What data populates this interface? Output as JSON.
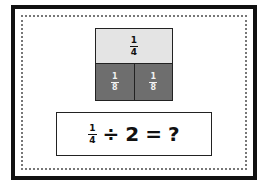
{
  "card": {
    "bar_model": {
      "top": {
        "numerator": "1",
        "denominator": "4"
      },
      "bottom": [
        {
          "numerator": "1",
          "denominator": "8"
        },
        {
          "numerator": "1",
          "denominator": "8"
        }
      ]
    },
    "equation": {
      "fraction": {
        "numerator": "1",
        "denominator": "4"
      },
      "operator": "÷",
      "divisor": "2",
      "equals": "=",
      "result": "?"
    }
  },
  "colors": {
    "top_fill": "#e4e4e4",
    "bottom_fill": "#6e6e6e",
    "border": "#111111"
  }
}
